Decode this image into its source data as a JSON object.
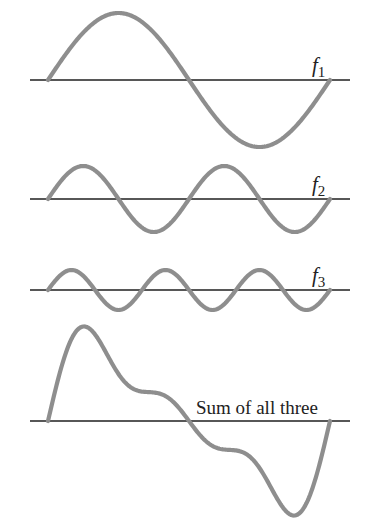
{
  "diagram": {
    "title": "",
    "colors": {
      "wave": "#8e8e8e",
      "axis": "#1f1f1f",
      "text": "#222222",
      "background": "#ffffff"
    },
    "x_start": 48,
    "x_end": 330,
    "axis_x_start": 30,
    "axis_x_end": 350,
    "panels": [
      {
        "id": "f1",
        "label_main": "f",
        "label_sub": "1",
        "axis_y": 80,
        "cycles": 1,
        "amplitude": 67,
        "label_x": 312,
        "label_y": 72
      },
      {
        "id": "f2",
        "label_main": "f",
        "label_sub": "2",
        "axis_y": 199,
        "cycles": 2,
        "amplitude": 33,
        "label_x": 312,
        "label_y": 191
      },
      {
        "id": "f3",
        "label_main": "f",
        "label_sub": "3",
        "axis_y": 290,
        "cycles": 3,
        "amplitude": 20,
        "label_x": 312,
        "label_y": 282
      },
      {
        "id": "sum",
        "label_main": "Sum of all three",
        "label_sub": "",
        "axis_y": 421,
        "cycles": 0,
        "amplitude": 0,
        "label_x": 196,
        "label_y": 414,
        "components": [
          "f1",
          "f2",
          "f3"
        ]
      }
    ]
  }
}
